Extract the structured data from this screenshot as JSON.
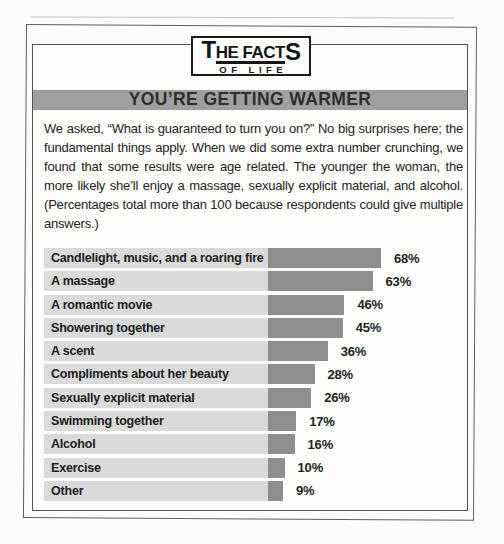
{
  "logo": {
    "t": "T",
    "he_fact": "HE FACT",
    "s": "S",
    "line2": "OF LIFE"
  },
  "header": {
    "title": "YOU’RE GETTING WARMER",
    "bg": "#9f9f9f",
    "text_color": "#2e2e2e"
  },
  "intro": {
    "text": "We asked, “What is guaranteed to turn you on?” No big surprises here; the fundamental things apply. When we did some extra number crunching, we found that some results were age related. The younger the woman, the more likely she’ll enjoy a massage, sexually explicit material, and alcohol. (Percentages total more than 100 because respondents could give multiple answers.)"
  },
  "chart_data": {
    "type": "bar",
    "orientation": "horizontal",
    "title": "YOU’RE GETTING WARMER",
    "categories": [
      "Candlelight, music, and a roaring fire",
      "A massage",
      "A romantic movie",
      "Showering together",
      "A scent",
      "Compliments about her beauty",
      "Sexually explicit material",
      "Swimming together",
      "Alcohol",
      "Exercise",
      "Other"
    ],
    "values": [
      68,
      63,
      46,
      45,
      36,
      28,
      26,
      17,
      16,
      10,
      9
    ],
    "value_labels": [
      "68%",
      "63%",
      "46%",
      "45%",
      "36%",
      "28%",
      "26%",
      "17%",
      "16%",
      "10%",
      "9%"
    ],
    "unit": "%",
    "value_axis_range": [
      0,
      100
    ],
    "grid": false,
    "legend": false,
    "bar_color": "#8e8e8e",
    "label_band_color": "#dadada",
    "note": "Percentages total more than 100 because respondents could give multiple answers."
  }
}
